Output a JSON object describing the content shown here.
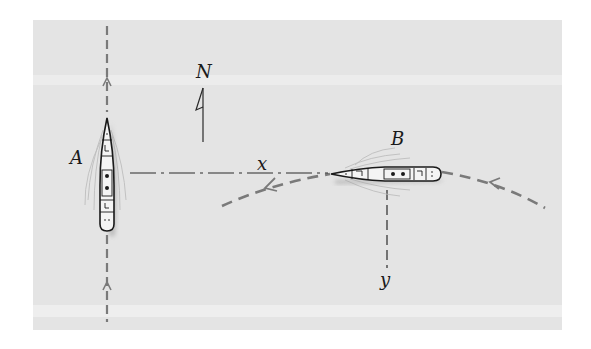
{
  "figure": {
    "background_color": "#e4e4e4",
    "path_color": "#7a7a7a",
    "line_color": "#2a2a2a",
    "labels": {
      "ship_a": "A",
      "ship_b": "B",
      "north": "N",
      "distance_x": "x",
      "distance_y": "y"
    },
    "elements": {
      "ship_a": {
        "heading": "north",
        "path": "straight dashed line, south-to-north"
      },
      "ship_b": {
        "heading": "west",
        "path": "curved dashed arc, east-to-west"
      },
      "compass": {
        "direction": "north",
        "label": "N"
      },
      "x_dimension": {
        "style": "dash-dot",
        "from": "ship A",
        "to": "ship B"
      },
      "y_dimension": {
        "style": "dashed",
        "from": "ship B",
        "direction": "down"
      }
    }
  }
}
